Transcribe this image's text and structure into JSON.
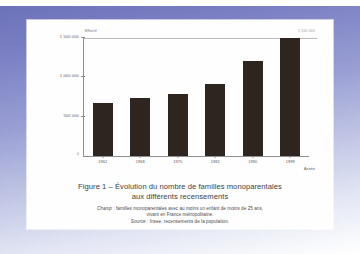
{
  "figure": {
    "caption_line1": "Figure 1 – Évolution du nombre de familles monoparentales",
    "caption_line2": "aux différents recensements",
    "note_champ_label": "Champ",
    "note_champ_line1": " : familles monoparentales avec au moins un enfant de moins de 25 ans,",
    "note_champ_line2": "vivant en France métropolitaine.",
    "note_source_label": "Source",
    "note_source_text": " : Insee, recensements de la population.",
    "top_right_value": "1 500 000"
  },
  "chart_data": {
    "type": "bar",
    "title": "Figure 1 – Évolution du nombre de familles monoparentales aux différents recensements",
    "xlabel": "Année",
    "ylabel": "Effectif",
    "categories": [
      "1962",
      "1968",
      "1975",
      "1982",
      "1990",
      "1999"
    ],
    "values": [
      675000,
      740000,
      790000,
      910000,
      1210000,
      1500000
    ],
    "ylim": [
      0,
      1500000
    ],
    "yticks": [
      0,
      500000,
      1000000,
      1500000
    ],
    "ytick_labels": [
      "0",
      "500 000",
      "1 000 000",
      "1 500 000"
    ],
    "grid": false,
    "legend": false,
    "bar_color": "#2e2420"
  }
}
